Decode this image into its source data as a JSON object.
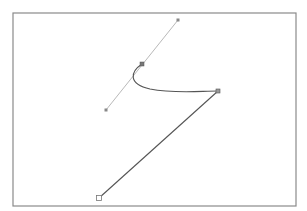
{
  "canvas": {
    "width": 307,
    "height": 211,
    "background": "#ffffff",
    "frame": {
      "x": 13,
      "y": 13,
      "width": 283,
      "height": 193,
      "stroke": "#8a8a8a"
    }
  },
  "path": {
    "stroke": "#555555",
    "anchors": [
      {
        "name": "anchor-top",
        "x": 142,
        "y": 64
      },
      {
        "name": "anchor-right",
        "x": 218,
        "y": 91
      },
      {
        "name": "anchor-bottom",
        "x": 99,
        "y": 198
      }
    ],
    "curve": "M142,64 C130,72 128,84 150,89 C175,94 200,91 218,91",
    "line": "M218,91 L99,198"
  },
  "handle": {
    "stroke": "#b0b0b0",
    "start": {
      "x": 106,
      "y": 110
    },
    "end": {
      "x": 178,
      "y": 20
    },
    "anchor": {
      "x": 142,
      "y": 64
    }
  }
}
